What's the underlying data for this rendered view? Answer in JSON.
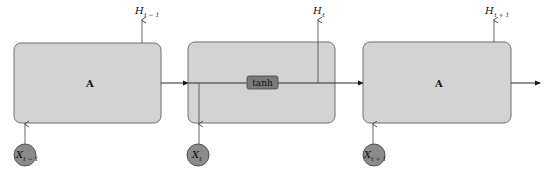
{
  "diagram": {
    "colors": {
      "cell_fill": "#d3d3d3",
      "cell_stroke": "#6e6e6e",
      "circle_fill": "#8b8b8b",
      "tanh_fill": "#7a7a7a",
      "line": "#2a2a2a"
    },
    "cells": [
      {
        "label": "A",
        "output": {
          "main": "H",
          "sub": "t − 1"
        },
        "input": {
          "main": "X",
          "sub": "t − 1"
        }
      },
      {
        "label": "tanh",
        "output": {
          "main": "H",
          "sub": "t"
        },
        "input": {
          "main": "X",
          "sub": "t"
        }
      },
      {
        "label": "A",
        "output": {
          "main": "H",
          "sub": "t + 1"
        },
        "input": {
          "main": "X",
          "sub": "t + 1"
        }
      }
    ]
  }
}
